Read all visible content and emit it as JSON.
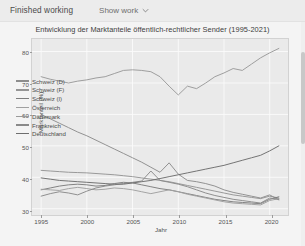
{
  "topbar": {
    "status_label": "Finished working",
    "show_work_label": "Show work",
    "chevron_icon": "chevron-down-icon"
  },
  "chart_data": {
    "type": "line",
    "title": "Entwicklung der Marktanteile öffentlich-rechtlicher Sender (1995-2021)",
    "xlabel": "Jahr",
    "ylabel": "Marktanteil (%)",
    "xlim": [
      1994,
      2022
    ],
    "ylim": [
      28,
      84
    ],
    "xticks": [
      1995,
      2000,
      2005,
      2010,
      2015,
      2020
    ],
    "yticks": [
      30,
      40,
      50,
      60,
      70,
      80
    ],
    "grid": true,
    "legend_position": "center-left",
    "x": [
      1995,
      1996,
      1997,
      1998,
      1999,
      2000,
      2001,
      2002,
      2003,
      2004,
      2005,
      2006,
      2007,
      2008,
      2009,
      2010,
      2011,
      2012,
      2013,
      2014,
      2015,
      2016,
      2017,
      2018,
      2019,
      2020,
      2021
    ],
    "series": [
      {
        "name": "Schweiz (D)",
        "color": "#8d8d8d",
        "values": [
          60.0,
          58.6,
          57.2,
          55.8,
          54.4,
          53.2,
          51.8,
          50.4,
          49.0,
          47.6,
          46.2,
          44.8,
          43.2,
          41.6,
          44.6,
          41.0,
          39.0,
          38.6,
          38.0,
          37.2,
          36.0,
          35.2,
          34.6,
          34.0,
          33.4,
          34.4,
          32.8
        ]
      },
      {
        "name": "Schweiz (F)",
        "color": "#959595",
        "values": [
          42.2,
          42.0,
          41.8,
          41.6,
          41.5,
          41.4,
          41.2,
          41.0,
          40.8,
          40.5,
          40.2,
          39.8,
          39.4,
          39.0,
          38.6,
          38.0,
          37.4,
          36.8,
          36.2,
          35.6,
          35.0,
          34.4,
          34.0,
          33.6,
          33.2,
          34.0,
          33.4
        ]
      },
      {
        "name": "Schweiz (I)",
        "color": "#7d7d7d",
        "values": [
          36.0,
          36.6,
          37.2,
          37.6,
          37.8,
          37.6,
          37.2,
          37.4,
          38.0,
          38.4,
          38.2,
          37.6,
          37.0,
          36.4,
          36.0,
          35.4,
          34.8,
          34.2,
          33.6,
          33.0,
          32.6,
          32.2,
          32.0,
          31.8,
          31.6,
          33.0,
          33.8
        ]
      },
      {
        "name": "Österreich",
        "color": "#a0a0a0",
        "values": [
          36.2,
          36.0,
          35.8,
          36.4,
          36.8,
          36.4,
          36.0,
          36.2,
          36.6,
          36.4,
          36.0,
          35.4,
          34.8,
          35.4,
          36.0,
          35.4,
          34.6,
          34.0,
          33.4,
          32.8,
          32.2,
          31.8,
          31.6,
          31.4,
          31.2,
          32.6,
          33.2
        ]
      },
      {
        "name": "Dänemark",
        "color": "#9a9a9a",
        "values": [
          72.0,
          71.2,
          70.6,
          70.0,
          70.6,
          71.0,
          71.6,
          72.0,
          73.0,
          74.0,
          74.2,
          74.0,
          73.6,
          72.0,
          69.0,
          66.2,
          69.0,
          68.2,
          70.0,
          72.0,
          73.2,
          74.6,
          74.0,
          76.0,
          78.0,
          79.6,
          81.0
        ]
      },
      {
        "name": "Frankreich",
        "color": "#8a8a8a",
        "values": [
          34.0,
          34.8,
          35.4,
          35.0,
          34.4,
          35.6,
          36.6,
          37.2,
          37.6,
          38.0,
          38.4,
          38.8,
          42.0,
          39.0,
          38.4,
          37.8,
          37.0,
          36.0,
          35.0,
          34.2,
          33.6,
          33.0,
          32.6,
          32.2,
          31.8,
          33.4,
          33.0
        ]
      },
      {
        "name": "Deutschland",
        "color": "#6e6e6e",
        "values": [
          39.8,
          39.4,
          39.0,
          38.8,
          38.6,
          38.4,
          38.2,
          38.0,
          37.8,
          37.8,
          38.2,
          38.6,
          39.0,
          39.6,
          40.2,
          40.8,
          41.4,
          42.0,
          42.6,
          43.2,
          43.8,
          44.6,
          45.4,
          46.2,
          47.0,
          48.4,
          50.0
        ]
      }
    ]
  }
}
